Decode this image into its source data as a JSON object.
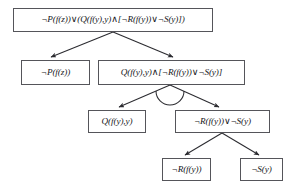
{
  "diagram": {
    "type": "tree",
    "background_color": "#ffffff",
    "node_border_color": "#55555a",
    "edge_color": "#2b2b30",
    "text_color": "#16161a",
    "nodes": [
      {
        "id": "root",
        "label": "¬P(f(z))∨(Q(f(y),y)∧[¬R(f(y))∨¬S(y)])",
        "row": 0
      },
      {
        "id": "np",
        "label": "¬P(f(z))",
        "row": 1
      },
      {
        "id": "conj",
        "label": "Q(f(y),y)∧[¬R(f(y))∨¬S(y)]",
        "row": 1
      },
      {
        "id": "q",
        "label": "Q(f(y),y)",
        "row": 2
      },
      {
        "id": "disj",
        "label": "¬R(f(y))∨¬S(y)",
        "row": 2
      },
      {
        "id": "nr",
        "label": "¬R(f(y))",
        "row": 3
      },
      {
        "id": "ns",
        "label": "¬S(y)",
        "row": 3
      }
    ],
    "edges": [
      {
        "from": "root",
        "to": "np",
        "split": "or",
        "arrow": true
      },
      {
        "from": "root",
        "to": "conj",
        "split": "or",
        "arrow": true
      },
      {
        "from": "conj",
        "to": "q",
        "split": "and",
        "arrow": true
      },
      {
        "from": "conj",
        "to": "disj",
        "split": "and",
        "arrow": true
      },
      {
        "from": "disj",
        "to": "nr",
        "split": "or",
        "arrow": true
      },
      {
        "from": "disj",
        "to": "ns",
        "split": "or",
        "arrow": true
      }
    ],
    "markers": [
      {
        "id": "and-arc",
        "between": [
          "q",
          "disj"
        ],
        "shape": "arc"
      }
    ]
  }
}
